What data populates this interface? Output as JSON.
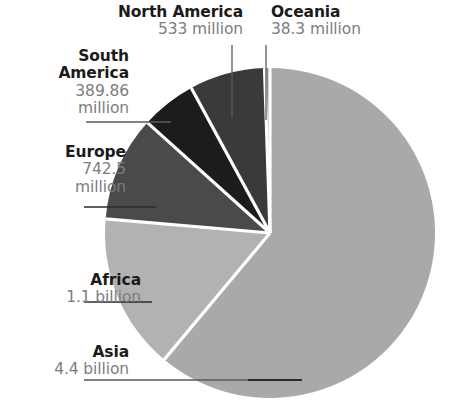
{
  "chart_data": {
    "type": "pie",
    "title": "",
    "subtitle": "",
    "xlabel": "",
    "ylabel": "",
    "legend_position": "callout-labels",
    "grid": false,
    "units": "people",
    "total_label": "7.2 billion",
    "categories": [
      "Asia",
      "Africa",
      "Europe",
      "North America",
      "South America",
      "Oceania"
    ],
    "values": [
      4400000000,
      1100000000,
      742500000,
      533000000,
      389860000,
      38300000
    ],
    "value_labels": [
      "4.4 billion",
      "1.1 billion",
      "742.5 million",
      "533 million",
      "389.86 million",
      "38.3 million"
    ],
    "percentages": [
      61.08,
      15.27,
      10.31,
      7.4,
      5.41,
      0.53
    ],
    "colors": [
      "#a9a9a9",
      "#b2b2b2",
      "#4a4a4a",
      "#3a3a3a",
      "#1c1c1c",
      "#8f8f8f"
    ],
    "start_angle_deg": 0,
    "direction": "clockwise",
    "slice_gap_color": "#ffffff",
    "background": "#ffffff",
    "slices": [
      {
        "name": "Asia",
        "value_label": "4.4 billion",
        "value": 4400000000,
        "percent": 61.08,
        "color": "#a9a9a9",
        "start_deg": 0,
        "end_deg": 219.9,
        "label_name": "Asia",
        "label_value": "4.4 billion"
      },
      {
        "name": "Africa",
        "value_label": "1.1 billion",
        "value": 1100000000,
        "percent": 15.27,
        "color": "#b2b2b2",
        "start_deg": 219.9,
        "end_deg": 274.9,
        "label_name": "Africa",
        "label_value": "1.1 billion"
      },
      {
        "name": "Europe",
        "value_label": "742.5 million",
        "value": 742500000,
        "percent": 10.31,
        "color": "#4a4a4a",
        "start_deg": 274.9,
        "end_deg": 312.0,
        "label_name": "Europe",
        "label_value_line1": "742.5",
        "label_value_line2": "million"
      },
      {
        "name": "South America",
        "value_label": "389.86 million",
        "value": 389860000,
        "percent": 5.41,
        "color": "#1c1c1c",
        "start_deg": 312.0,
        "end_deg": 331.5,
        "label_name_line1": "South",
        "label_name_line2": "America",
        "label_value_line1": "389.86",
        "label_value_line2": "million"
      },
      {
        "name": "North America",
        "value_label": "533 million",
        "value": 533000000,
        "percent": 7.4,
        "color": "#3a3a3a",
        "start_deg": 331.5,
        "end_deg": 358.1,
        "label_name": "North America",
        "label_value": "533 million"
      },
      {
        "name": "Oceania",
        "value_label": "38.3 million",
        "value": 38300000,
        "percent": 0.53,
        "color": "#8f8f8f",
        "start_deg": 358.1,
        "end_deg": 360.0,
        "label_name": "Oceania",
        "label_value": "38.3 million"
      }
    ]
  },
  "labels": {
    "north_america": {
      "name": "North America",
      "value": "533 million"
    },
    "oceania": {
      "name": "Oceania",
      "value": "38.3 million"
    },
    "south_america": {
      "name_line1": "South",
      "name_line2": "America",
      "value_line1": "389.86",
      "value_line2": "million"
    },
    "europe": {
      "name": "Europe",
      "value_line1": "742.5",
      "value_line2": "million"
    },
    "africa": {
      "name": "Africa",
      "value": "1.1 billion"
    },
    "asia": {
      "name": "Asia",
      "value": "4.4 billion"
    }
  }
}
